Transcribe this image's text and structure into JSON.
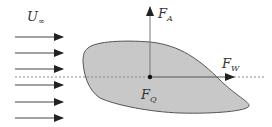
{
  "diagram": {
    "type": "fluid-force-diagram",
    "labels": {
      "freestream": {
        "main": "U",
        "sub": "∞"
      },
      "lift": {
        "main": "F",
        "sub": "A"
      },
      "drag": {
        "main": "F",
        "sub": "W"
      },
      "force_point": {
        "main": "F",
        "sub": "Q"
      }
    },
    "flow_arrows_count": 6,
    "colors": {
      "body_fill": "#c8c8c8",
      "body_stroke": "#555555",
      "arrows": "#333333",
      "axis_line": "#777777"
    }
  }
}
